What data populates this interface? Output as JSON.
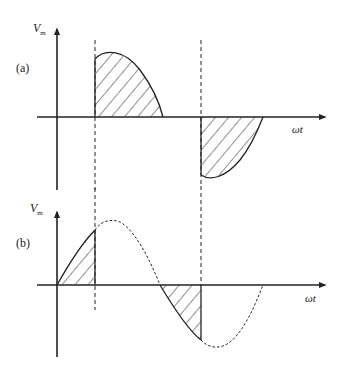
{
  "panels": [
    {
      "id": "a",
      "label": "(a)",
      "y_axis_label": "V",
      "y_axis_sub": "m",
      "x_axis_label": "ωt"
    },
    {
      "id": "b",
      "label": "(b)",
      "y_axis_label": "V",
      "y_axis_sub": "m",
      "x_axis_label": "ωt"
    }
  ],
  "colors": {
    "stroke": "#222222",
    "background": "#ffffff"
  }
}
